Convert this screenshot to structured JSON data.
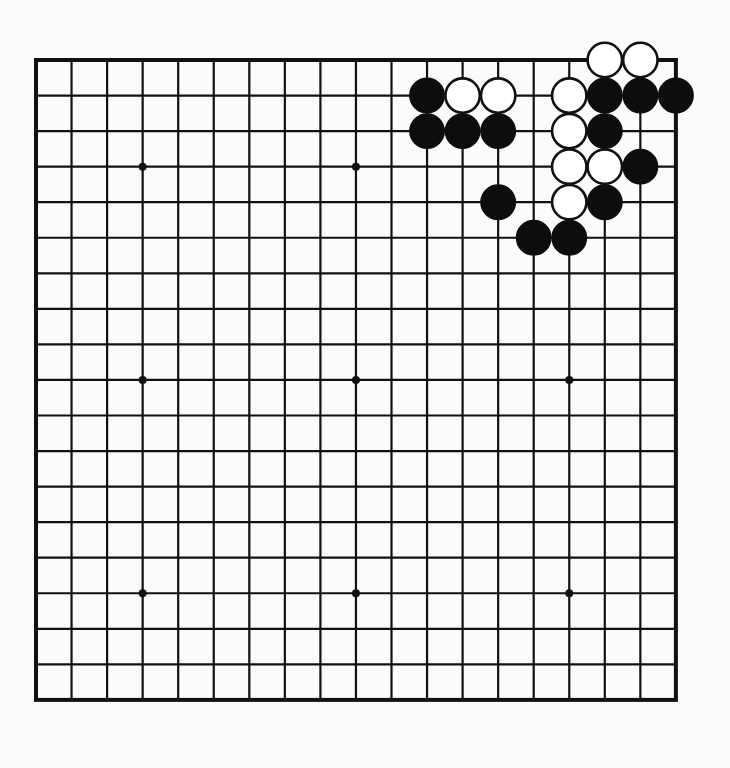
{
  "board": {
    "size": 19,
    "origin_x": 36,
    "origin_y": 60,
    "spacing": 35.55,
    "stone_radius": 17.2,
    "hoshi_radius": 4,
    "colors": {
      "line": "#111111",
      "black_stone": "#0d0d0d",
      "white_stone": "#ffffff",
      "background": "#fbfbfa"
    },
    "hoshi": [
      [
        3,
        3
      ],
      [
        9,
        3
      ],
      [
        15,
        3
      ],
      [
        3,
        9
      ],
      [
        9,
        9
      ],
      [
        15,
        9
      ],
      [
        3,
        15
      ],
      [
        9,
        15
      ],
      [
        15,
        15
      ]
    ],
    "stones": [
      {
        "color": "white",
        "col": 16,
        "row": 0
      },
      {
        "color": "white",
        "col": 17,
        "row": 0
      },
      {
        "color": "black",
        "col": 11,
        "row": 1
      },
      {
        "color": "white",
        "col": 12,
        "row": 1
      },
      {
        "color": "white",
        "col": 13,
        "row": 1
      },
      {
        "color": "white",
        "col": 15,
        "row": 1
      },
      {
        "color": "black",
        "col": 16,
        "row": 1
      },
      {
        "color": "black",
        "col": 17,
        "row": 1
      },
      {
        "color": "black",
        "col": 18,
        "row": 1
      },
      {
        "color": "black",
        "col": 11,
        "row": 2
      },
      {
        "color": "black",
        "col": 12,
        "row": 2
      },
      {
        "color": "black",
        "col": 13,
        "row": 2
      },
      {
        "color": "white",
        "col": 15,
        "row": 2
      },
      {
        "color": "black",
        "col": 16,
        "row": 2
      },
      {
        "color": "white",
        "col": 15,
        "row": 3
      },
      {
        "color": "white",
        "col": 16,
        "row": 3
      },
      {
        "color": "black",
        "col": 17,
        "row": 3
      },
      {
        "color": "black",
        "col": 13,
        "row": 4
      },
      {
        "color": "white",
        "col": 15,
        "row": 4
      },
      {
        "color": "black",
        "col": 16,
        "row": 4
      },
      {
        "color": "black",
        "col": 14,
        "row": 5
      },
      {
        "color": "black",
        "col": 15,
        "row": 5
      }
    ]
  }
}
